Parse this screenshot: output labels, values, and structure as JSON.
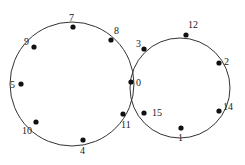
{
  "diagram": {
    "type": "two tangent circles with labeled points",
    "circles": [
      {
        "name": "left-circle",
        "cx": 72,
        "cy": 84,
        "r": 62
      },
      {
        "name": "right-circle",
        "cx": 180,
        "cy": 88,
        "r": 50
      }
    ],
    "points": [
      {
        "label": "7",
        "x": 73,
        "y": 27,
        "lx": 69,
        "ly": 21
      },
      {
        "label": "9",
        "x": 34,
        "y": 47,
        "lx": 24,
        "ly": 45
      },
      {
        "label": "8",
        "x": 111,
        "y": 40,
        "lx": 114,
        "ly": 34
      },
      {
        "label": "5",
        "x": 21,
        "y": 84,
        "lx": 10,
        "ly": 88
      },
      {
        "label": "10",
        "x": 36,
        "y": 122,
        "lx": 22,
        "ly": 134
      },
      {
        "label": "4",
        "x": 83,
        "y": 140,
        "lx": 80,
        "ly": 154
      },
      {
        "label": "11",
        "x": 123,
        "y": 114,
        "lx": 121,
        "ly": 128
      },
      {
        "label": "0",
        "x": 131,
        "y": 82,
        "lx": 136,
        "ly": 86
      },
      {
        "label": "3",
        "x": 144,
        "y": 49,
        "lx": 136,
        "ly": 47
      },
      {
        "label": "12",
        "x": 186,
        "y": 35,
        "lx": 188,
        "ly": 28
      },
      {
        "label": "2",
        "x": 219,
        "y": 63,
        "lx": 224,
        "ly": 65
      },
      {
        "label": "14",
        "x": 219,
        "y": 111,
        "lx": 223,
        "ly": 110
      },
      {
        "label": "1",
        "x": 181,
        "y": 128,
        "lx": 178,
        "ly": 141
      },
      {
        "label": "15",
        "x": 144,
        "y": 113,
        "lx": 152,
        "ly": 116
      }
    ]
  }
}
